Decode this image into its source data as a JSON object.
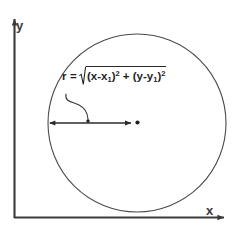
{
  "figure": {
    "background_color": "#ffffff",
    "stroke_color": "#3a3a3a",
    "text_color": "#1f1f1f"
  },
  "axes": {
    "y_label": "y",
    "x_label": "x",
    "origin": {
      "x": 14,
      "y": 218
    },
    "y_axis_top": 16,
    "x_axis_right": 228
  },
  "circle": {
    "center_x": 137,
    "center_y": 123,
    "radius": 89,
    "stroke_color": "#4a4a4a"
  },
  "radius_arrow": {
    "start_x": 48,
    "end_x": 133,
    "y": 123,
    "label": "r"
  },
  "center_point": {
    "x": 137,
    "y": 123
  },
  "leader_dot": {
    "x": 88,
    "y": 121
  },
  "formula": {
    "lhs": "r =",
    "radicand_prefix": "(x-x",
    "sub_one": "1",
    "close_sq_1": ")",
    "exp_1": "2",
    "plus": " + (y-y",
    "sub_two": "1",
    "close_sq_2": ")",
    "exp_2": "2",
    "plain_text": "r = √((x-x₁)² + (y-y₁)²)"
  }
}
